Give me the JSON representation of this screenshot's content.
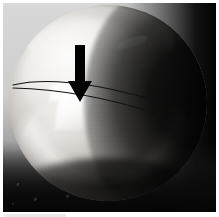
{
  "figure": {
    "domain": "Natural-Image",
    "caption": "",
    "background_color": "#ffffff",
    "plate": {
      "x": 3,
      "y": 3,
      "width": 213,
      "height": 209,
      "backdrop_color": "#d4d4d4",
      "shadow_color": "#0a0a0a"
    }
  },
  "scene": {
    "sphere": {
      "label": "sphere",
      "highlight_color": "#f2f1ee",
      "body_color": "#d2cfc9",
      "shadow_color": "#0a0a0a",
      "center_x": 105,
      "center_y": 100,
      "radius_x": 99,
      "radius_y": 98
    },
    "features": [
      {
        "name": "upper-left-sheen",
        "description": "broad diffuse highlight on the upper left of the sphere"
      },
      {
        "name": "top-rim-light",
        "description": "thin bright rim along the top edge of the sphere"
      },
      {
        "name": "specular-glint",
        "description": "small elongated white glint on the upper right shoulder"
      },
      {
        "name": "defect-gleam",
        "description": "bright vertical white gleam just below the arrow tip"
      },
      {
        "name": "lower-crescent",
        "description": "bright crescent arc across the lower belly of the sphere"
      },
      {
        "name": "contact-shadow",
        "description": "dark contact shadow where the sphere meets the surface"
      }
    ]
  },
  "annotations": {
    "arrow": {
      "name": "down-arrow",
      "color": "#000000",
      "direction": "down",
      "x": 62,
      "y": 42,
      "width": 30,
      "height": 58,
      "shaft_width": 10,
      "head_width": 24,
      "head_height": 20,
      "tip_x": 77,
      "tip_y": 100
    },
    "curves": [
      {
        "name": "upper-latitude-line",
        "color": "#111111",
        "stroke_width": 1.1,
        "path": "M 10 82 C 45 74, 92 80, 150 97"
      },
      {
        "name": "lower-latitude-line",
        "color": "#111111",
        "stroke_width": 1.1,
        "path": "M 10 85 C 45 86, 96 92, 152 110"
      }
    ]
  }
}
